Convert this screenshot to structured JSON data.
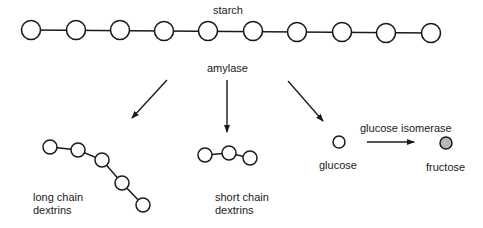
{
  "diagram": {
    "starch": {
      "label": "starch",
      "residue_count": 10
    },
    "enzyme_1": {
      "label": "amylase"
    },
    "products": {
      "long_chain": {
        "label_line1": "long chain",
        "label_line2": "dextrins",
        "residue_count": 5
      },
      "short_chain": {
        "label_line1": "short chain",
        "label_line2": "dextrins",
        "residue_count": 3
      },
      "glucose": {
        "label": "glucose",
        "residue_count": 1
      }
    },
    "enzyme_2": {
      "label": "glucose isomerase"
    },
    "final_product": {
      "label": "fructose",
      "fill_color": "#b8b8b8"
    },
    "colors": {
      "stroke": "#1a1a1a",
      "background": "#ffffff"
    }
  }
}
